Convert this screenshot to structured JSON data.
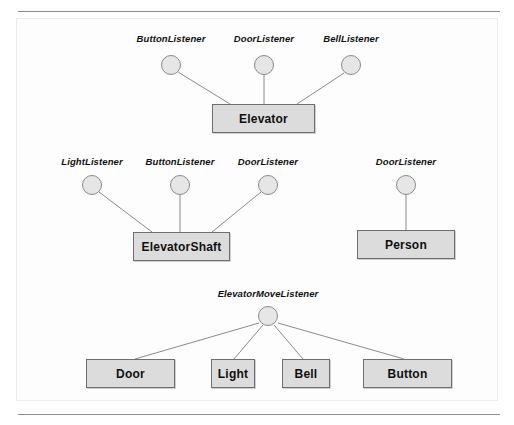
{
  "figure": {
    "kind": "uml-lollipop-diagram",
    "background": "#ffffff",
    "frame_color": "#ececec",
    "rule_color": "#8d8d8d",
    "node_fill": "#dcdcdc",
    "node_border": "#6e6e6e",
    "lollipop_fill": "#e6e6e6",
    "lollipop_border": "#8a8a8a",
    "line_color": "#8a8a8a"
  },
  "groups": [
    {
      "id": "elevator-group",
      "class_name": "Elevator",
      "interfaces": [
        "ButtonListener",
        "DoorListener",
        "BellListener"
      ]
    },
    {
      "id": "elevatorshaft-group",
      "class_name": "ElevatorShaft",
      "interfaces": [
        "LightListener",
        "ButtonListener",
        "DoorListener"
      ]
    },
    {
      "id": "person-group",
      "class_name": "Person",
      "interfaces": [
        "DoorListener"
      ]
    },
    {
      "id": "elevatormovelistener-group",
      "interface_name": "ElevatorMoveListener",
      "implementors": [
        "Door",
        "Light",
        "Bell",
        "Button"
      ]
    }
  ],
  "nodes": {
    "elevator": "Elevator",
    "elevator_shaft": "ElevatorShaft",
    "person": "Person",
    "door": "Door",
    "light": "Light",
    "bell": "Bell",
    "button": "Button"
  },
  "labels": {
    "row1": {
      "button_listener": "ButtonListener",
      "door_listener": "DoorListener",
      "bell_listener": "BellListener"
    },
    "row2": {
      "light_listener": "LightListener",
      "button_listener": "ButtonListener",
      "door_listener": "DoorListener"
    },
    "row2_right": {
      "door_listener": "DoorListener"
    },
    "row3": {
      "elevator_move_listener": "ElevatorMoveListener"
    }
  }
}
